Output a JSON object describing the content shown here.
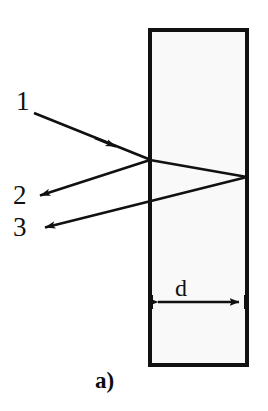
{
  "figure": {
    "panel_label": "a)",
    "caption_letter": "a",
    "background_color": "#ffffff",
    "stroke_color": "#111111"
  },
  "plate": {
    "name": "transparent-plate",
    "fill_color": "#f9f9f9",
    "border_color": "#111111",
    "x": 150,
    "y": 30,
    "width": 97,
    "height": 335
  },
  "dimension": {
    "label": "d",
    "arrow_y": 302,
    "x_start": 151,
    "x_end": 246
  },
  "rays": [
    {
      "id": "ray-1",
      "label": "1",
      "role": "incident-ray",
      "from": [
        34,
        113
      ],
      "to": [
        150,
        160
      ],
      "arrow_at": [
        114,
        146
      ]
    },
    {
      "id": "ray-2",
      "label": "2",
      "role": "reflected-ray-front-surface",
      "from": [
        150,
        160
      ],
      "to": [
        38,
        196
      ],
      "arrow_at": [
        38,
        196
      ]
    },
    {
      "id": "ray-3",
      "label": "3",
      "role": "reflected-ray-back-surface",
      "from": [
        247,
        177
      ],
      "to": [
        43,
        228
      ],
      "arrow_at": [
        43,
        228
      ]
    }
  ],
  "internal_path": {
    "name": "refracted-segment",
    "from": [
      150,
      160
    ],
    "to": [
      247,
      177
    ]
  }
}
